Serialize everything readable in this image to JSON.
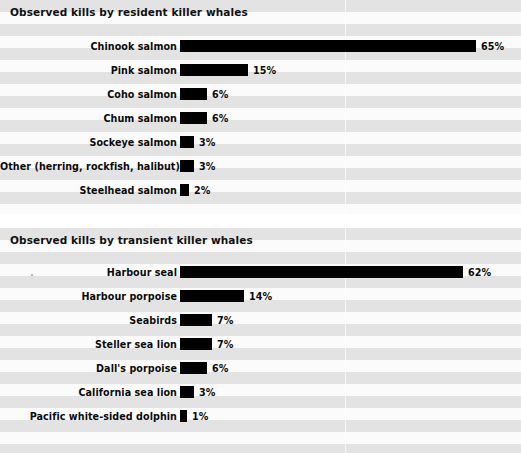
{
  "chart_data": [
    {
      "type": "bar",
      "orientation": "horizontal",
      "title": "Observed kills by resident killer whales",
      "xlabel": "",
      "ylabel": "",
      "value_suffix": "%",
      "xlim": [
        0,
        65
      ],
      "grid": false,
      "legend": "none",
      "categories": [
        "Chinook salmon",
        "Pink salmon",
        "Coho salmon",
        "Chum salmon",
        "Sockeye salmon",
        "Other (herring, rockfish, halibut)",
        "Steelhead salmon"
      ],
      "values": [
        65,
        15,
        6,
        6,
        3,
        3,
        2
      ],
      "value_labels": [
        "65%",
        "15%",
        "6%",
        "6%",
        "3%",
        "3%",
        "2%"
      ]
    },
    {
      "type": "bar",
      "orientation": "horizontal",
      "title": "Observed kills by transient killer whales",
      "xlabel": "",
      "ylabel": "",
      "value_suffix": "%",
      "xlim": [
        0,
        62
      ],
      "grid": false,
      "legend": "none",
      "categories": [
        "Harbour seal",
        "Harbour porpoise",
        "Seabirds",
        "Steller sea lion",
        "Dall's porpoise",
        "California sea lion",
        "Pacific white-sided dolphin"
      ],
      "values": [
        62,
        14,
        7,
        7,
        6,
        3,
        1
      ],
      "value_labels": [
        "62%",
        "14%",
        "7%",
        "7%",
        "6%",
        "3%",
        "1%"
      ]
    }
  ],
  "style": {
    "bar_color": "#000000",
    "panel_background": "#f7f7f7",
    "stripe_dark": "#e3e3e3",
    "stripe_light": "#fbfbfb",
    "text_color": "#0a0a0a"
  }
}
